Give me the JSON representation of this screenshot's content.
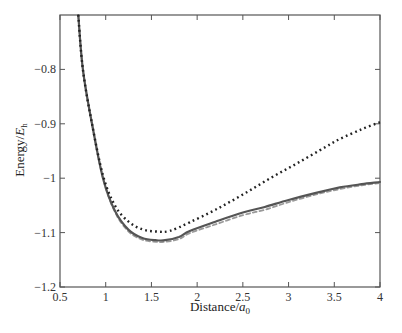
{
  "chart_data": {
    "type": "line",
    "title": "",
    "xlabel": "Distance/a0",
    "xlabel_main": "Distance/",
    "xlabel_var": "a",
    "xlabel_sub": "0",
    "ylabel": "Energy/Eh",
    "ylabel_main": "Energy/",
    "ylabel_var": "E",
    "ylabel_sub": "h",
    "xlim": [
      0.5,
      4
    ],
    "ylim": [
      -1.2,
      -0.7
    ],
    "xticks": [
      0.5,
      1,
      1.5,
      2,
      2.5,
      3,
      3.5,
      4
    ],
    "xtick_labels": [
      "0.5",
      "1",
      "1.5",
      "2",
      "2.5",
      "3",
      "3.5",
      "4"
    ],
    "yticks": [
      -1.2,
      -1.1,
      -1.0,
      -0.9,
      -0.8
    ],
    "ytick_labels": [
      "−1.2",
      "−1.1",
      "−1",
      "−0.9",
      "−0.8"
    ],
    "grid": false,
    "legend": null,
    "series": [
      {
        "name": "dotted",
        "style": "dotted",
        "color": "#222222",
        "x": [
          0.7,
          0.75,
          0.85,
          0.97,
          1.1,
          1.25,
          1.4,
          1.55,
          1.7,
          1.92,
          2.2,
          2.5,
          2.8,
          3.1,
          3.4,
          3.56,
          3.8,
          4.0
        ],
        "y": [
          -0.7,
          -0.8,
          -0.9,
          -0.995,
          -1.05,
          -1.08,
          -1.094,
          -1.098,
          -1.097,
          -1.081,
          -1.058,
          -1.03,
          -1.0,
          -0.972,
          -0.943,
          -0.928,
          -0.91,
          -0.897
        ]
      },
      {
        "name": "solid",
        "style": "solid",
        "color": "#555555",
        "x": [
          0.7,
          0.75,
          0.85,
          0.97,
          1.1,
          1.25,
          1.4,
          1.55,
          1.65,
          1.8,
          1.92,
          2.2,
          2.5,
          2.74,
          3.0,
          3.3,
          3.56,
          3.8,
          4.0
        ],
        "y": [
          -0.7,
          -0.8,
          -0.9,
          -1.0,
          -1.06,
          -1.095,
          -1.11,
          -1.114,
          -1.114,
          -1.108,
          -1.097,
          -1.08,
          -1.063,
          -1.053,
          -1.04,
          -1.027,
          -1.017,
          -1.011,
          -1.007
        ]
      },
      {
        "name": "dashed",
        "style": "dashed",
        "color": "#999999",
        "x": [
          0.7,
          0.75,
          0.85,
          0.97,
          1.1,
          1.25,
          1.4,
          1.55,
          1.65,
          1.8,
          1.92,
          2.2,
          2.5,
          2.74,
          3.0,
          3.3,
          3.56,
          3.8,
          4.0
        ],
        "y": [
          -0.7,
          -0.8,
          -0.9,
          -1.0,
          -1.062,
          -1.098,
          -1.113,
          -1.117,
          -1.117,
          -1.112,
          -1.101,
          -1.085,
          -1.068,
          -1.058,
          -1.044,
          -1.03,
          -1.02,
          -1.013,
          -1.009
        ]
      }
    ]
  }
}
